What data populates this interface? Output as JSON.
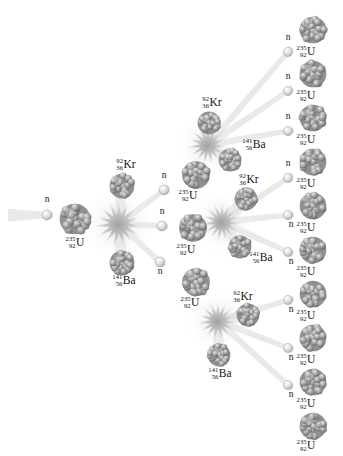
{
  "figure": {
    "type": "nuclear-fission-chain-reaction",
    "title": "",
    "background_color": "#ffffff",
    "nucleus_color": "#8a8a8a",
    "neutron_color": "#d2d2d2",
    "burst_color": "#c9c9c9",
    "beam_color": "#dcdcdc",
    "text_color": "#111111"
  },
  "species": {
    "uranium": {
      "symbol": "U",
      "mass": "235",
      "atomic": "92"
    },
    "krypton": {
      "symbol": "Kr",
      "mass": "92",
      "atomic": "36"
    },
    "barium": {
      "symbol": "Ba",
      "mass": "141",
      "atomic": "56"
    },
    "neutron": {
      "symbol": "n"
    }
  },
  "generations": [
    {
      "id": "gen0",
      "label": "incident neutron",
      "fissions": 1,
      "neutrons_released": 3
    },
    {
      "id": "gen1",
      "label": "first generation",
      "fissions": 3,
      "neutrons_released": 9
    },
    {
      "id": "gen2",
      "label": "second generation",
      "fissions": 0,
      "neutrons_released": 0
    }
  ],
  "nuclei": [
    {
      "name": "incident-neutron",
      "kind": "neutron",
      "x": 47,
      "y": 215,
      "r": 5.0,
      "label_pos": "above"
    },
    {
      "name": "target-uranium-gen0",
      "kind": "uranium",
      "x": 75,
      "y": 219,
      "r": 15.5,
      "label_pos": "below"
    },
    {
      "name": "fragment-krypton-gen1",
      "kind": "krypton",
      "x": 122,
      "y": 186,
      "r": 12.5,
      "label_pos": "above"
    },
    {
      "name": "fragment-barium-gen1",
      "kind": "barium",
      "x": 122,
      "y": 263,
      "r": 12.5,
      "label_pos": "below"
    },
    {
      "name": "neutron-gen1-a",
      "kind": "neutron",
      "x": 164,
      "y": 190,
      "r": 5.0,
      "label_pos": "above"
    },
    {
      "name": "neutron-gen1-b",
      "kind": "neutron",
      "x": 162,
      "y": 226,
      "r": 5.0,
      "label_pos": "above"
    },
    {
      "name": "neutron-gen1-c",
      "kind": "neutron",
      "x": 160,
      "y": 262,
      "r": 5.0,
      "label_pos": "below"
    },
    {
      "name": "target-uranium-gen1-top",
      "kind": "uranium",
      "x": 196,
      "y": 175,
      "r": 14.0,
      "label_pos": "below"
    },
    {
      "name": "target-uranium-gen1-mid",
      "kind": "uranium",
      "x": 193,
      "y": 228,
      "r": 14.0,
      "label_pos": "below"
    },
    {
      "name": "target-uranium-gen1-bot",
      "kind": "uranium",
      "x": 196,
      "y": 282,
      "r": 14.0,
      "label_pos": "below"
    },
    {
      "name": "fragment-krypton-gen2-top",
      "kind": "krypton",
      "x": 209,
      "y": 123,
      "r": 11.5,
      "label_pos": "above"
    },
    {
      "name": "fragment-barium-gen2-top",
      "kind": "barium",
      "x": 230,
      "y": 160,
      "r": 11.5,
      "label_pos": "right"
    },
    {
      "name": "fragment-krypton-gen2-mid",
      "kind": "krypton",
      "x": 246,
      "y": 199,
      "r": 11.5,
      "label_pos": "above"
    },
    {
      "name": "fragment-barium-gen2-mid",
      "kind": "barium",
      "x": 240,
      "y": 247,
      "r": 11.5,
      "label_pos": "right"
    },
    {
      "name": "fragment-krypton-gen2-bot",
      "kind": "krypton",
      "x": 248,
      "y": 315,
      "r": 11.5,
      "label_pos": "right"
    },
    {
      "name": "fragment-barium-gen2-bot",
      "kind": "barium",
      "x": 219,
      "y": 355,
      "r": 11.5,
      "label_pos": "below"
    },
    {
      "name": "neutron-gen2-1",
      "kind": "neutron",
      "x": 288,
      "y": 52,
      "r": 4.6,
      "label_pos": "above"
    },
    {
      "name": "neutron-gen2-2",
      "kind": "neutron",
      "x": 288,
      "y": 91,
      "r": 4.6,
      "label_pos": "above"
    },
    {
      "name": "neutron-gen2-3",
      "kind": "neutron",
      "x": 288,
      "y": 131,
      "r": 4.6,
      "label_pos": "above"
    },
    {
      "name": "neutron-gen2-4",
      "kind": "neutron",
      "x": 288,
      "y": 178,
      "r": 4.6,
      "label_pos": "above"
    },
    {
      "name": "neutron-gen2-5",
      "kind": "neutron",
      "x": 288,
      "y": 215,
      "r": 4.6,
      "label_pos": "below"
    },
    {
      "name": "neutron-gen2-6",
      "kind": "neutron",
      "x": 288,
      "y": 252,
      "r": 4.6,
      "label_pos": "below"
    },
    {
      "name": "neutron-gen2-7",
      "kind": "neutron",
      "x": 288,
      "y": 300,
      "r": 4.6,
      "label_pos": "below"
    },
    {
      "name": "neutron-gen2-8",
      "kind": "neutron",
      "x": 288,
      "y": 348,
      "r": 4.6,
      "label_pos": "below"
    },
    {
      "name": "neutron-gen2-9",
      "kind": "neutron",
      "x": 288,
      "y": 385,
      "r": 4.6,
      "label_pos": "below"
    },
    {
      "name": "target-uranium-gen2-1",
      "kind": "uranium",
      "x": 313,
      "y": 30,
      "r": 13.5,
      "label_pos": "below"
    },
    {
      "name": "target-uranium-gen2-2",
      "kind": "uranium",
      "x": 313,
      "y": 74,
      "r": 13.5,
      "label_pos": "below"
    },
    {
      "name": "target-uranium-gen2-3",
      "kind": "uranium",
      "x": 313,
      "y": 118,
      "r": 13.5,
      "label_pos": "below"
    },
    {
      "name": "target-uranium-gen2-4",
      "kind": "uranium",
      "x": 313,
      "y": 162,
      "r": 13.5,
      "label_pos": "below"
    },
    {
      "name": "target-uranium-gen2-5",
      "kind": "uranium",
      "x": 313,
      "y": 206,
      "r": 13.5,
      "label_pos": "below"
    },
    {
      "name": "target-uranium-gen2-6",
      "kind": "uranium",
      "x": 313,
      "y": 250,
      "r": 13.5,
      "label_pos": "below"
    },
    {
      "name": "target-uranium-gen2-7",
      "kind": "uranium",
      "x": 313,
      "y": 294,
      "r": 13.5,
      "label_pos": "below"
    },
    {
      "name": "target-uranium-gen2-8",
      "kind": "uranium",
      "x": 313,
      "y": 338,
      "r": 13.5,
      "label_pos": "below"
    },
    {
      "name": "target-uranium-gen2-9",
      "kind": "uranium",
      "x": 313,
      "y": 382,
      "r": 13.5,
      "label_pos": "below"
    },
    {
      "name": "target-uranium-gen2-10",
      "kind": "uranium",
      "x": 313,
      "y": 426,
      "r": 13.5,
      "label_pos": "below"
    }
  ],
  "bursts": [
    {
      "name": "fission-burst-gen0",
      "x": 119,
      "y": 224,
      "r": 27
    },
    {
      "name": "fission-burst-gen1-top",
      "x": 208,
      "y": 145,
      "r": 23
    },
    {
      "name": "fission-burst-gen1-mid",
      "x": 222,
      "y": 222,
      "r": 23
    },
    {
      "name": "fission-burst-gen1-bot",
      "x": 218,
      "y": 321,
      "r": 23
    }
  ],
  "beams": [
    {
      "name": "beam-incident",
      "x1": 8,
      "y1": 215,
      "x2": 47,
      "y2": 215,
      "w1": 13,
      "w2": 5
    },
    {
      "name": "beam-gen0-krypton",
      "x1": 119,
      "y1": 224,
      "x2": 122,
      "y2": 186,
      "w1": 8,
      "w2": 13
    },
    {
      "name": "beam-gen0-barium",
      "x1": 119,
      "y1": 224,
      "x2": 122,
      "y2": 263,
      "w1": 8,
      "w2": 13
    },
    {
      "name": "beam-gen0-neutron-a",
      "x1": 119,
      "y1": 224,
      "x2": 164,
      "y2": 190,
      "w1": 7,
      "w2": 5
    },
    {
      "name": "beam-gen0-neutron-b",
      "x1": 119,
      "y1": 224,
      "x2": 162,
      "y2": 226,
      "w1": 7,
      "w2": 5
    },
    {
      "name": "beam-gen0-neutron-c",
      "x1": 119,
      "y1": 224,
      "x2": 160,
      "y2": 262,
      "w1": 7,
      "w2": 5
    },
    {
      "name": "beam-gen1-top-krypton",
      "x1": 208,
      "y1": 145,
      "x2": 209,
      "y2": 123,
      "w1": 8,
      "w2": 12
    },
    {
      "name": "beam-gen1-top-barium",
      "x1": 208,
      "y1": 145,
      "x2": 230,
      "y2": 160,
      "w1": 8,
      "w2": 12
    },
    {
      "name": "beam-gen1-top-n1",
      "x1": 208,
      "y1": 145,
      "x2": 288,
      "y2": 52,
      "w1": 7,
      "w2": 5
    },
    {
      "name": "beam-gen1-top-n2",
      "x1": 208,
      "y1": 145,
      "x2": 288,
      "y2": 91,
      "w1": 7,
      "w2": 5
    },
    {
      "name": "beam-gen1-top-n3",
      "x1": 208,
      "y1": 145,
      "x2": 288,
      "y2": 131,
      "w1": 7,
      "w2": 5
    },
    {
      "name": "beam-gen1-mid-krypton",
      "x1": 222,
      "y1": 222,
      "x2": 246,
      "y2": 199,
      "w1": 8,
      "w2": 12
    },
    {
      "name": "beam-gen1-mid-barium",
      "x1": 222,
      "y1": 222,
      "x2": 240,
      "y2": 247,
      "w1": 8,
      "w2": 12
    },
    {
      "name": "beam-gen1-mid-n4",
      "x1": 222,
      "y1": 222,
      "x2": 288,
      "y2": 178,
      "w1": 7,
      "w2": 5
    },
    {
      "name": "beam-gen1-mid-n5",
      "x1": 222,
      "y1": 222,
      "x2": 288,
      "y2": 215,
      "w1": 7,
      "w2": 5
    },
    {
      "name": "beam-gen1-mid-n6",
      "x1": 222,
      "y1": 222,
      "x2": 288,
      "y2": 252,
      "w1": 7,
      "w2": 5
    },
    {
      "name": "beam-gen1-bot-krypton",
      "x1": 218,
      "y1": 321,
      "x2": 248,
      "y2": 315,
      "w1": 8,
      "w2": 12
    },
    {
      "name": "beam-gen1-bot-barium",
      "x1": 218,
      "y1": 321,
      "x2": 219,
      "y2": 355,
      "w1": 8,
      "w2": 12
    },
    {
      "name": "beam-gen1-bot-n7",
      "x1": 218,
      "y1": 321,
      "x2": 288,
      "y2": 300,
      "w1": 7,
      "w2": 5
    },
    {
      "name": "beam-gen1-bot-n8",
      "x1": 218,
      "y1": 321,
      "x2": 288,
      "y2": 348,
      "w1": 7,
      "w2": 5
    },
    {
      "name": "beam-gen1-bot-n9",
      "x1": 218,
      "y1": 321,
      "x2": 288,
      "y2": 385,
      "w1": 7,
      "w2": 5
    }
  ],
  "labels": [
    {
      "name": "label-neutron-incident",
      "kind": "neutron",
      "x": 47,
      "y": 200
    },
    {
      "name": "label-uranium-gen0",
      "kind": "uranium",
      "x": 75,
      "y": 243
    },
    {
      "name": "label-krypton-gen1",
      "kind": "krypton",
      "x": 126,
      "y": 165
    },
    {
      "name": "label-barium-gen1",
      "kind": "barium",
      "x": 124,
      "y": 281
    },
    {
      "name": "label-neutron-gen1-a",
      "kind": "neutron",
      "x": 164,
      "y": 176
    },
    {
      "name": "label-neutron-gen1-b",
      "kind": "neutron",
      "x": 162,
      "y": 212
    },
    {
      "name": "label-neutron-gen1-c",
      "kind": "neutron",
      "x": 160,
      "y": 272
    },
    {
      "name": "label-uranium-gen1-top",
      "kind": "uranium",
      "x": 188,
      "y": 196
    },
    {
      "name": "label-uranium-gen1-mid",
      "kind": "uranium",
      "x": 186,
      "y": 250
    },
    {
      "name": "label-uranium-gen1-bot",
      "kind": "uranium",
      "x": 190,
      "y": 303
    },
    {
      "name": "label-krypton-gen2-top",
      "kind": "krypton",
      "x": 212,
      "y": 103
    },
    {
      "name": "label-barium-gen2-top",
      "kind": "barium",
      "x": 254,
      "y": 145
    },
    {
      "name": "label-krypton-gen2-mid",
      "kind": "krypton",
      "x": 249,
      "y": 180
    },
    {
      "name": "label-barium-gen2-mid",
      "kind": "barium",
      "x": 261,
      "y": 258
    },
    {
      "name": "label-krypton-gen2-bot",
      "kind": "krypton",
      "x": 243,
      "y": 297
    },
    {
      "name": "label-barium-gen2-bot",
      "kind": "barium",
      "x": 220,
      "y": 374
    },
    {
      "name": "label-neutron-gen2-1",
      "kind": "neutron",
      "x": 288,
      "y": 38
    },
    {
      "name": "label-neutron-gen2-2",
      "kind": "neutron",
      "x": 288,
      "y": 77
    },
    {
      "name": "label-neutron-gen2-3",
      "kind": "neutron",
      "x": 288,
      "y": 117
    },
    {
      "name": "label-neutron-gen2-4",
      "kind": "neutron",
      "x": 288,
      "y": 164
    },
    {
      "name": "label-neutron-gen2-5",
      "kind": "neutron",
      "x": 291,
      "y": 225
    },
    {
      "name": "label-neutron-gen2-6",
      "kind": "neutron",
      "x": 291,
      "y": 262
    },
    {
      "name": "label-neutron-gen2-7",
      "kind": "neutron",
      "x": 291,
      "y": 310
    },
    {
      "name": "label-neutron-gen2-8",
      "kind": "neutron",
      "x": 291,
      "y": 358
    },
    {
      "name": "label-neutron-gen2-9",
      "kind": "neutron",
      "x": 291,
      "y": 395
    },
    {
      "name": "label-uranium-gen2-1",
      "kind": "uranium",
      "x": 306,
      "y": 52
    },
    {
      "name": "label-uranium-gen2-2",
      "kind": "uranium",
      "x": 306,
      "y": 96
    },
    {
      "name": "label-uranium-gen2-3",
      "kind": "uranium",
      "x": 306,
      "y": 140
    },
    {
      "name": "label-uranium-gen2-4",
      "kind": "uranium",
      "x": 306,
      "y": 184
    },
    {
      "name": "label-uranium-gen2-5",
      "kind": "uranium",
      "x": 306,
      "y": 228
    },
    {
      "name": "label-uranium-gen2-6",
      "kind": "uranium",
      "x": 306,
      "y": 272
    },
    {
      "name": "label-uranium-gen2-7",
      "kind": "uranium",
      "x": 306,
      "y": 316
    },
    {
      "name": "label-uranium-gen2-8",
      "kind": "uranium",
      "x": 306,
      "y": 360
    },
    {
      "name": "label-uranium-gen2-9",
      "kind": "uranium",
      "x": 306,
      "y": 404
    },
    {
      "name": "label-uranium-gen2-10",
      "kind": "uranium",
      "x": 306,
      "y": 446
    }
  ]
}
